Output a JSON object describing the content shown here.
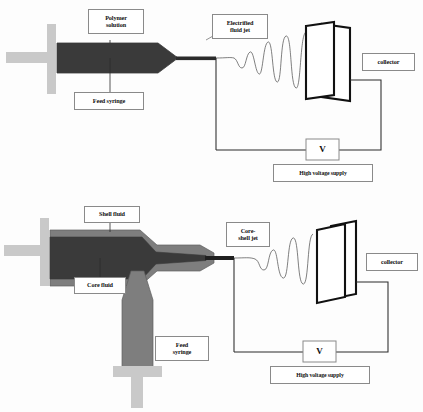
{
  "figure": {
    "type": "schematic-diagram"
  },
  "colors": {
    "polymer_dark": "#3a3a3a",
    "shell_gray": "#7e7e7e",
    "plunger_light": "#c9c9c9",
    "line": "#2b2b2b",
    "label_border": "#8a8a8a",
    "background": "#ffffff"
  },
  "panels": [
    {
      "id": "single-fluid",
      "name": "single-fluid-electrospinning",
      "labels": {
        "polymer_solution": "Polymer\nsolution",
        "feed_syringe": "Feed syringe",
        "electrified_jet": "Electrified\nfluid jet",
        "collector": "collector",
        "voltmeter": "V",
        "high_voltage_supply": "High voltage supply"
      }
    },
    {
      "id": "coaxial-core-shell",
      "name": "coaxial-core-shell-electrospinning",
      "labels": {
        "shell_fluid": "Shell fluid",
        "core_fluid": "Core fluid",
        "feed_syringe": "Feed\nsyringe",
        "core_shell_jet": "Core-\nshell jet",
        "collector": "collector",
        "voltmeter": "V",
        "high_voltage_supply": "High voltage supply"
      }
    }
  ],
  "icons": {
    "syringe": "syringe-icon",
    "plunger": "plunger-icon",
    "needle": "needle-icon",
    "jet": "whipping-jet-icon",
    "collector_plate": "collector-plate-icon",
    "wire": "circuit-wire-icon",
    "voltage_source": "voltage-source-icon"
  }
}
